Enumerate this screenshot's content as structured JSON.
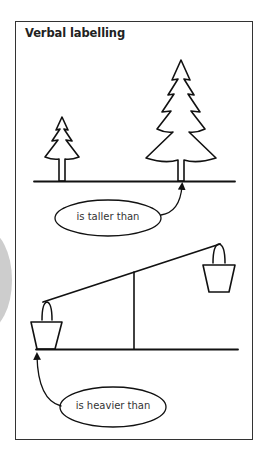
{
  "figure": {
    "title": "Verbal labelling",
    "panels": [
      {
        "name": "trees",
        "relation_label": "is taller than",
        "objects": [
          "small-tree",
          "tall-tree"
        ]
      },
      {
        "name": "balance-scale",
        "relation_label": "is heavier than",
        "objects": [
          "left-bucket-low",
          "right-bucket-high"
        ]
      }
    ]
  },
  "colors": {
    "stroke": "#111111",
    "frame": "#333333",
    "background": "#ffffff",
    "side_tab": "#cdcdcd"
  }
}
